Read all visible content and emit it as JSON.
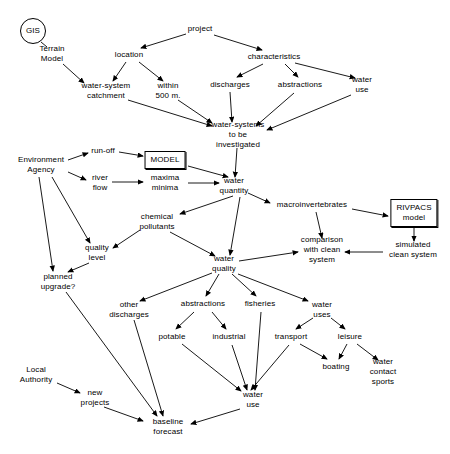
{
  "diagram": {
    "background": "#ffffff",
    "stroke": "#000000",
    "nodes": [
      {
        "id": "gis",
        "label": "GIS",
        "x": 33,
        "y": 31,
        "shape": "circle"
      },
      {
        "id": "terrain-model",
        "label": "Terrain\nModel",
        "x": 52,
        "y": 54,
        "shape": "plain"
      },
      {
        "id": "project",
        "label": "project",
        "x": 200,
        "y": 29,
        "shape": "plain"
      },
      {
        "id": "location",
        "label": "location",
        "x": 129,
        "y": 55,
        "shape": "plain"
      },
      {
        "id": "characteristics",
        "label": "characteristics",
        "x": 274,
        "y": 57,
        "shape": "plain"
      },
      {
        "id": "water-system-catchment",
        "label": "water-system\ncatchment",
        "x": 106,
        "y": 91,
        "shape": "plain"
      },
      {
        "id": "within-500m",
        "label": "within\n500 m.",
        "x": 168,
        "y": 91,
        "shape": "plain"
      },
      {
        "id": "discharges",
        "label": "discharges",
        "x": 230,
        "y": 85,
        "shape": "plain"
      },
      {
        "id": "abstractions-top",
        "label": "abstractions",
        "x": 300,
        "y": 85,
        "shape": "plain"
      },
      {
        "id": "water-use-top",
        "label": "water\nuse",
        "x": 362,
        "y": 85,
        "shape": "plain"
      },
      {
        "id": "water-systems-investigated",
        "label": "water-systems\nto be\ninvestigated",
        "x": 238,
        "y": 135,
        "shape": "plain"
      },
      {
        "id": "environment-agency",
        "label": "Environment\nAgency",
        "x": 41,
        "y": 165,
        "shape": "plain"
      },
      {
        "id": "run-off",
        "label": "run-off",
        "x": 103,
        "y": 151,
        "shape": "plain"
      },
      {
        "id": "model",
        "label": "MODEL",
        "x": 165,
        "y": 160,
        "shape": "box"
      },
      {
        "id": "river-flow",
        "label": "river\nflow",
        "x": 100,
        "y": 183,
        "shape": "plain"
      },
      {
        "id": "maxima-minima",
        "label": "maxima\nminima",
        "x": 165,
        "y": 183,
        "shape": "plain"
      },
      {
        "id": "water-quantity",
        "label": "water\nquantity",
        "x": 234,
        "y": 186,
        "shape": "plain"
      },
      {
        "id": "macroinvertebrates",
        "label": "macroinvertebrates",
        "x": 312,
        "y": 205,
        "shape": "plain"
      },
      {
        "id": "rivpacs-model",
        "label": "RIVPACS\nmodel",
        "x": 414,
        "y": 213,
        "shape": "box"
      },
      {
        "id": "chemical-pollutants",
        "label": "chemical\npollutants",
        "x": 157,
        "y": 222,
        "shape": "plain"
      },
      {
        "id": "comparison-clean",
        "label": "comparison\nwith clean\nsystem",
        "x": 322,
        "y": 250,
        "shape": "plain"
      },
      {
        "id": "simulated-clean",
        "label": "simulated\nclean system",
        "x": 413,
        "y": 250,
        "shape": "plain"
      },
      {
        "id": "quality-level",
        "label": "quality\nlevel",
        "x": 97,
        "y": 253,
        "shape": "plain"
      },
      {
        "id": "water-quality",
        "label": "water\nquality",
        "x": 224,
        "y": 264,
        "shape": "plain"
      },
      {
        "id": "planned-upgrade",
        "label": "planned\nupgrade?",
        "x": 58,
        "y": 282,
        "shape": "plain"
      },
      {
        "id": "other-discharges",
        "label": "other\ndischarges",
        "x": 129,
        "y": 310,
        "shape": "plain"
      },
      {
        "id": "abstractions-bot",
        "label": "abstractions",
        "x": 203,
        "y": 304,
        "shape": "plain"
      },
      {
        "id": "fisheries",
        "label": "fisheries",
        "x": 260,
        "y": 304,
        "shape": "plain"
      },
      {
        "id": "water-uses",
        "label": "water\nuses",
        "x": 322,
        "y": 310,
        "shape": "plain"
      },
      {
        "id": "potable",
        "label": "potable",
        "x": 172,
        "y": 337,
        "shape": "plain"
      },
      {
        "id": "industrial",
        "label": "industrial",
        "x": 229,
        "y": 337,
        "shape": "plain"
      },
      {
        "id": "transport",
        "label": "transport",
        "x": 291,
        "y": 337,
        "shape": "plain"
      },
      {
        "id": "leisure",
        "label": "leisure",
        "x": 350,
        "y": 337,
        "shape": "plain"
      },
      {
        "id": "boating",
        "label": "boating",
        "x": 336,
        "y": 367,
        "shape": "plain"
      },
      {
        "id": "water-contact-sports",
        "label": "water\ncontact\nsports",
        "x": 383,
        "y": 372,
        "shape": "plain"
      },
      {
        "id": "water-use-bot",
        "label": "water\nuse",
        "x": 253,
        "y": 400,
        "shape": "plain"
      },
      {
        "id": "local-authority",
        "label": "Local\nAuthority",
        "x": 36,
        "y": 375,
        "shape": "plain"
      },
      {
        "id": "new-projects",
        "label": "new\nprojects",
        "x": 95,
        "y": 398,
        "shape": "plain"
      },
      {
        "id": "baseline-forecast",
        "label": "baseline\nforecast",
        "x": 168,
        "y": 427,
        "shape": "plain"
      }
    ],
    "edges": [
      {
        "from": "gis",
        "to": "terrain-model",
        "arrow": false,
        "path": "M41,42 L47,47"
      },
      {
        "from": "terrain-model",
        "to": "water-system-catchment",
        "arrow": true,
        "path": "M63,64 L84,83"
      },
      {
        "from": "project",
        "to": "location",
        "arrow": true,
        "path": "M186,34 L141,48"
      },
      {
        "from": "project",
        "to": "characteristics",
        "arrow": true,
        "path": "M214,35 L262,50"
      },
      {
        "from": "location",
        "to": "water-system-catchment",
        "arrow": true,
        "path": "M126,62 L113,81"
      },
      {
        "from": "location",
        "to": "within-500m",
        "arrow": true,
        "path": "M139,62 L163,81"
      },
      {
        "from": "characteristics",
        "to": "discharges",
        "arrow": true,
        "path": "M263,64 L237,77"
      },
      {
        "from": "characteristics",
        "to": "abstractions-top",
        "arrow": true,
        "path": "M285,64 L298,77"
      },
      {
        "from": "characteristics",
        "to": "water-use-top",
        "arrow": true,
        "path": "M295,63 L355,78"
      },
      {
        "from": "water-system-catchment",
        "to": "water-systems-investigated",
        "arrow": true,
        "path": "M128,100 L212,126"
      },
      {
        "from": "within-500m",
        "to": "water-systems-investigated",
        "arrow": true,
        "path": "M178,100 L212,123"
      },
      {
        "from": "discharges",
        "to": "water-systems-investigated",
        "arrow": true,
        "path": "M230,92 L232,122"
      },
      {
        "from": "abstractions-top",
        "to": "water-systems-investigated",
        "arrow": true,
        "path": "M294,93 L256,126"
      },
      {
        "from": "water-use-top",
        "to": "water-systems-investigated",
        "arrow": true,
        "path": "M351,95 L267,130"
      },
      {
        "from": "water-systems-investigated",
        "to": "water-quantity",
        "arrow": true,
        "path": "M237,148 L235,177"
      },
      {
        "from": "environment-agency",
        "to": "run-off",
        "arrow": true,
        "path": "M68,160 L88,153"
      },
      {
        "from": "environment-agency",
        "to": "river-flow",
        "arrow": true,
        "path": "M68,172 L86,180"
      },
      {
        "from": "environment-agency",
        "to": "planned-upgrade",
        "arrow": true,
        "path": "M39,177 L53,271"
      },
      {
        "from": "environment-agency",
        "to": "quality-level",
        "arrow": true,
        "path": "M52,177 L90,243"
      },
      {
        "from": "run-off",
        "to": "model",
        "arrow": true,
        "path": "M119,152 L143,156"
      },
      {
        "from": "model",
        "to": "water-quantity",
        "arrow": true,
        "path": "M188,166 L228,177"
      },
      {
        "from": "river-flow",
        "to": "maxima-minima",
        "arrow": true,
        "path": "M112,182 L143,182"
      },
      {
        "from": "maxima-minima",
        "to": "water-quantity",
        "arrow": true,
        "path": "M188,183 L219,183"
      },
      {
        "from": "water-quantity",
        "to": "macroinvertebrates",
        "arrow": true,
        "path": "M248,193 L270,203"
      },
      {
        "from": "water-quantity",
        "to": "chemical-pollutants",
        "arrow": true,
        "path": "M233,196 L180,214"
      },
      {
        "from": "water-quantity",
        "to": "water-quality",
        "arrow": true,
        "path": "M240,197 L230,255"
      },
      {
        "from": "macroinvertebrates",
        "to": "rivpacs-model",
        "arrow": true,
        "path": "M352,209 L388,216"
      },
      {
        "from": "macroinvertebrates",
        "to": "comparison-clean",
        "arrow": true,
        "path": "M316,212 L322,238"
      },
      {
        "from": "rivpacs-model",
        "to": "simulated-clean",
        "arrow": true,
        "path": "M414,227 L414,241"
      },
      {
        "from": "simulated-clean",
        "to": "comparison-clean",
        "arrow": true,
        "path": "M383,252 L345,252"
      },
      {
        "from": "chemical-pollutants",
        "to": "quality-level",
        "arrow": true,
        "path": "M140,230 L113,248"
      },
      {
        "from": "chemical-pollutants",
        "to": "water-quality",
        "arrow": true,
        "path": "M170,232 L215,256"
      },
      {
        "from": "quality-level",
        "to": "planned-upgrade",
        "arrow": true,
        "path": "M89,263 L68,272"
      },
      {
        "from": "water-quality",
        "to": "comparison-clean",
        "arrow": true,
        "path": "M239,261 L298,252"
      },
      {
        "from": "water-quality",
        "to": "other-discharges",
        "arrow": true,
        "path": "M212,273 L140,301"
      },
      {
        "from": "water-quality",
        "to": "abstractions-bot",
        "arrow": true,
        "path": "M219,274 L206,296"
      },
      {
        "from": "water-quality",
        "to": "fisheries",
        "arrow": true,
        "path": "M232,274 L256,296"
      },
      {
        "from": "water-quality",
        "to": "water-uses",
        "arrow": true,
        "path": "M238,274 L308,301"
      },
      {
        "from": "abstractions-bot",
        "to": "potable",
        "arrow": true,
        "path": "M194,312 L176,329"
      },
      {
        "from": "abstractions-bot",
        "to": "industrial",
        "arrow": true,
        "path": "M212,312 L226,329"
      },
      {
        "from": "water-uses",
        "to": "transport",
        "arrow": true,
        "path": "M313,318 L296,329"
      },
      {
        "from": "water-uses",
        "to": "leisure",
        "arrow": true,
        "path": "M331,318 L345,329"
      },
      {
        "from": "leisure",
        "to": "boating",
        "arrow": true,
        "path": "M347,344 L339,359"
      },
      {
        "from": "leisure",
        "to": "water-contact-sports",
        "arrow": true,
        "path": "M357,344 L378,360"
      },
      {
        "from": "transport",
        "to": "boating",
        "arrow": true,
        "path": "M300,344 L327,359"
      },
      {
        "from": "transport",
        "to": "water-use-bot",
        "arrow": true,
        "path": "M289,345 L251,390"
      },
      {
        "from": "potable",
        "to": "water-use-bot",
        "arrow": true,
        "path": "M182,344 L241,391"
      },
      {
        "from": "industrial",
        "to": "water-use-bot",
        "arrow": true,
        "path": "M232,345 L247,390"
      },
      {
        "from": "fisheries",
        "to": "water-use-bot",
        "arrow": true,
        "path": "M261,312 L255,390"
      },
      {
        "from": "other-discharges",
        "to": "baseline-forecast",
        "arrow": true,
        "path": "M134,320 L163,416"
      },
      {
        "from": "planned-upgrade",
        "to": "baseline-forecast",
        "arrow": true,
        "path": "M66,292 L157,416"
      },
      {
        "from": "local-authority",
        "to": "new-projects",
        "arrow": true,
        "path": "M57,383 L80,393"
      },
      {
        "from": "new-projects",
        "to": "baseline-forecast",
        "arrow": true,
        "path": "M104,407 L143,421"
      },
      {
        "from": "water-use-bot",
        "to": "baseline-forecast",
        "arrow": true,
        "path": "M240,409 L191,424"
      }
    ]
  }
}
